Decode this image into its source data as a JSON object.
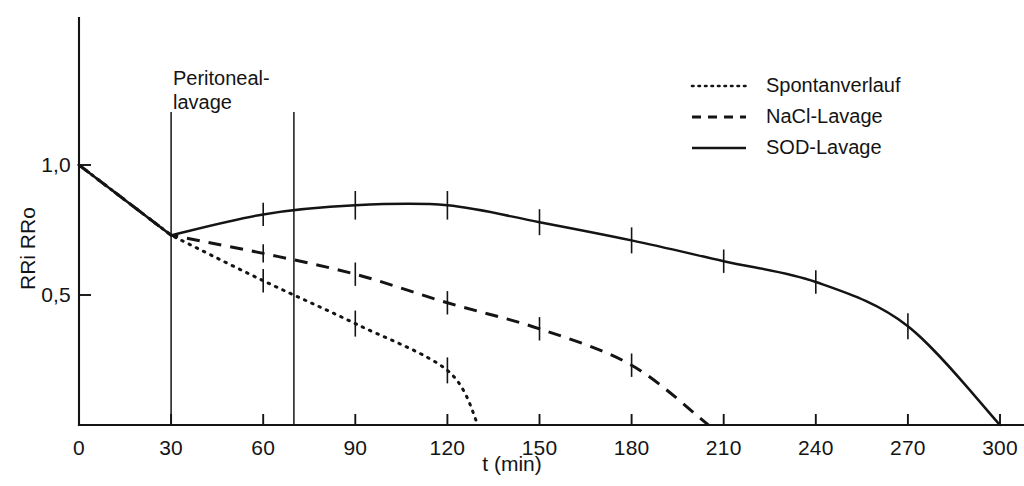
{
  "annotation": {
    "line1": "Peritoneal-",
    "line2": "lavage"
  },
  "legend": {
    "items": [
      {
        "label": "Spontanverlauf",
        "style": "dotted",
        "icon": "dotted-line-icon"
      },
      {
        "label": "NaCl-Lavage",
        "style": "dashed",
        "icon": "dashed-line-icon"
      },
      {
        "label": "SOD-Lavage",
        "style": "solid",
        "icon": "solid-line-icon"
      }
    ]
  },
  "axes": {
    "x_title": "t (min)",
    "y_title": "RRi RRo",
    "x_ticks": [
      "0",
      "30",
      "60",
      "90",
      "120",
      "150",
      "180",
      "210",
      "240",
      "270",
      "300"
    ],
    "y_ticks": [
      "0,5",
      "1,0"
    ]
  },
  "chart_data": {
    "type": "line",
    "title": "",
    "xlabel": "t (min)",
    "ylabel": "RRi RRo",
    "xlim": [
      0,
      300
    ],
    "ylim": [
      0,
      1.15
    ],
    "x_tick_values": [
      0,
      30,
      60,
      90,
      120,
      150,
      180,
      210,
      240,
      270,
      300
    ],
    "y_tick_values": [
      0.5,
      1.0
    ],
    "y_tick_labels": [
      "0,5",
      "1,0"
    ],
    "grid": false,
    "legend_position": "top-right",
    "annotations": [
      {
        "text": "Peritoneal-lavage",
        "type": "interval-marker",
        "x_start": 30,
        "x_end": 70
      }
    ],
    "series": [
      {
        "name": "Spontanverlauf",
        "style": "dotted",
        "x": [
          0,
          30,
          60,
          90,
          120,
          130
        ],
        "values": [
          1.0,
          0.73,
          0.555,
          0.39,
          0.21,
          0.0
        ],
        "errorbar_x": [
          0,
          60,
          90,
          120
        ],
        "errorbar_half_height": [
          0.0,
          0.045,
          0.05,
          0.05
        ]
      },
      {
        "name": "NaCl-Lavage",
        "style": "dashed",
        "x": [
          0,
          30,
          60,
          90,
          120,
          150,
          180,
          205
        ],
        "values": [
          1.0,
          0.73,
          0.66,
          0.58,
          0.47,
          0.37,
          0.23,
          0.0
        ],
        "errorbar_x": [
          60,
          90,
          120,
          150,
          180
        ],
        "errorbar_half_height": [
          0.035,
          0.045,
          0.045,
          0.045,
          0.045
        ]
      },
      {
        "name": "SOD-Lavage",
        "style": "solid",
        "x": [
          0,
          30,
          60,
          90,
          120,
          150,
          180,
          210,
          240,
          270,
          300
        ],
        "values": [
          1.0,
          0.73,
          0.81,
          0.845,
          0.845,
          0.78,
          0.71,
          0.63,
          0.55,
          0.38,
          0.0
        ],
        "errorbar_x": [
          60,
          90,
          120,
          150,
          180,
          210,
          240,
          270
        ],
        "errorbar_half_height": [
          0.045,
          0.055,
          0.055,
          0.05,
          0.05,
          0.045,
          0.045,
          0.05
        ]
      }
    ]
  }
}
